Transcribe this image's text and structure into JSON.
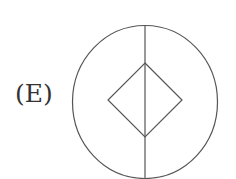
{
  "option": {
    "label": "(E)"
  },
  "figure": {
    "stroke_color": "#555555",
    "circle": {
      "cx": 145,
      "cy": 102,
      "rx": 73,
      "ry": 77
    },
    "vertical_line": {
      "x": 145,
      "y1": 25,
      "y2": 179
    },
    "diamond": {
      "top": [
        145,
        63
      ],
      "right": [
        182,
        100
      ],
      "bottom": [
        145,
        137
      ],
      "left": [
        108,
        100
      ]
    }
  }
}
